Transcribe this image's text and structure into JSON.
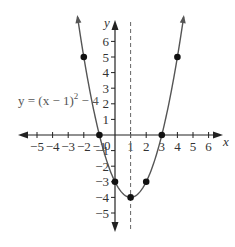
{
  "chart_data": {
    "type": "line",
    "title": "",
    "function": "y = (x-1)^2 - 4",
    "equation_label": {
      "prefix": "y = (x − 1)",
      "exponent": "2",
      "suffix": " − 4"
    },
    "xlabel": "x",
    "ylabel": "y",
    "xlim": [
      -5.5,
      6.6
    ],
    "ylim": [
      -5.5,
      6.6
    ],
    "grid": false,
    "x_ticks": [
      -5,
      -4,
      -3,
      -2,
      -1,
      1,
      2,
      3,
      4,
      5,
      6
    ],
    "x_tick_labels": [
      "−5",
      "−4",
      "−3",
      "−2",
      "−1",
      "1",
      "2",
      "3",
      "4",
      "5",
      "6"
    ],
    "y_ticks": [
      -5,
      -4,
      -3,
      -2,
      -1,
      1,
      2,
      3,
      4,
      5,
      6
    ],
    "y_tick_labels": [
      "−5",
      "−4",
      "−3",
      "−2",
      "−1",
      "1",
      "2",
      "3",
      "4",
      "5",
      "6"
    ],
    "origin_label": "0",
    "axis_of_symmetry": {
      "x": 1,
      "style": "dashed"
    },
    "series": [
      {
        "name": "y = (x-1)^2 - 4",
        "points": [
          {
            "x": -2,
            "y": 5
          },
          {
            "x": -1,
            "y": 0
          },
          {
            "x": 0,
            "y": -3
          },
          {
            "x": 1,
            "y": -4
          },
          {
            "x": 2,
            "y": -3
          },
          {
            "x": 3,
            "y": 0
          },
          {
            "x": 4,
            "y": 5
          }
        ]
      }
    ],
    "colors": {
      "axis": "#222222",
      "curve": "#555555",
      "points": "#111111",
      "dashed": "#666666"
    }
  }
}
